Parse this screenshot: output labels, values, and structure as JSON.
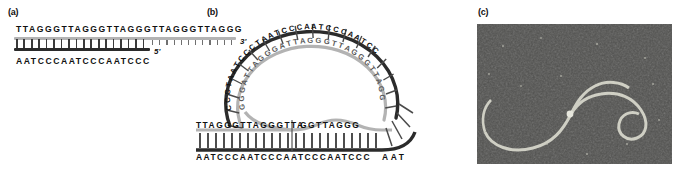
{
  "figure": {
    "panels": [
      {
        "id": "a",
        "label": "(a)",
        "caption_text": "Linear telomere duplex with single-stranded 3' G-rich overhang"
      },
      {
        "id": "b",
        "label": "(b)",
        "caption_text": "t-loop formed by strand invasion of the 3' overhang into duplex telomeric DNA"
      },
      {
        "id": "c",
        "label": "(c)",
        "caption_text": "Electron micrograph of a t-loop"
      }
    ]
  },
  "panel_a": {
    "label": "(a)",
    "top_strand_sequence": "TTAGGGTTAGGGTTAGGGTTAGGGTTAGGG",
    "bottom_strand_sequence": "AATCCCAATCCCAATCCC",
    "three_prime_label": "3'",
    "five_prime_label": "5'",
    "duplex_base_pairs": 18,
    "overhang_bases": 12,
    "strand_colors": {
      "g_rich_strand": "#b3b3b3",
      "c_rich_strand": "#2b2b2b",
      "rung": "#3a3a3a"
    }
  },
  "panel_b": {
    "label": "(b)",
    "loop_outer_sequence": "CCCTAATCCCTAATCCCAATCCCAATCC",
    "loop_inner_sequence": "GGGATTAGGGATTAGGGTTAGGGTTAGG",
    "duplex_top_sequence_left": "TTAGGGTTAGGGTTA",
    "duplex_top_sequence_right": "GGTTAGGG",
    "duplex_bottom_sequence": "AATCCCAATCCCAATCCCAATCCC",
    "tail_bottom_sequence": "AAT",
    "invading_strand_sequence": "GGGTTAGGGTTAGGGTT",
    "displacement_loop_sequence": "TTAGG",
    "strand_colors": {
      "g_rich_strand": "#b3b3b3",
      "c_rich_strand": "#2b2b2b"
    }
  },
  "panel_c": {
    "label": "(c)",
    "image_type": "electron-micrograph",
    "background_color": "#0d0d0d",
    "filament_color": "#d8d8cf"
  }
}
